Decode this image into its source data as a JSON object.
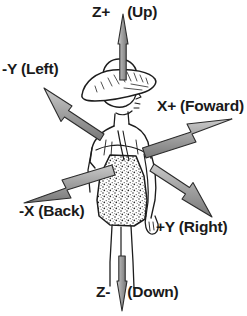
{
  "diagram": {
    "background_color": "#ffffff",
    "arrow_fill_color": "#9a9a9a",
    "arrow_outline_color": "#2b2b2b",
    "text_color": "#1a1a1a",
    "figure_ink_color": "#1d1d1d"
  },
  "axes": [
    {
      "id": "z-plus",
      "axis_text": "Z+",
      "direction_text": "(Up)",
      "full_label": "Z+ (Up)",
      "split_by_arrow": true,
      "points": "up"
    },
    {
      "id": "y-minus",
      "axis_text": "-Y",
      "direction_text": "(Left)",
      "full_label": "-Y (Left)",
      "split_by_arrow": false,
      "points": "upper-left"
    },
    {
      "id": "x-plus",
      "axis_text": "X+",
      "direction_text": "(Foward)",
      "full_label": "X+ (Foward)",
      "split_by_arrow": false,
      "points": "upper-right"
    },
    {
      "id": "x-minus",
      "axis_text": "-X",
      "direction_text": "(Back)",
      "full_label": "-X (Back)",
      "split_by_arrow": false,
      "points": "lower-left"
    },
    {
      "id": "y-plus",
      "axis_text": "+Y",
      "direction_text": "(Right)",
      "full_label": "+Y (Right)",
      "split_by_arrow": false,
      "points": "lower-right"
    },
    {
      "id": "z-minus",
      "axis_text": "Z-",
      "direction_text": "(Down)",
      "full_label": "Z- (Down)",
      "split_by_arrow": true,
      "points": "down"
    }
  ]
}
